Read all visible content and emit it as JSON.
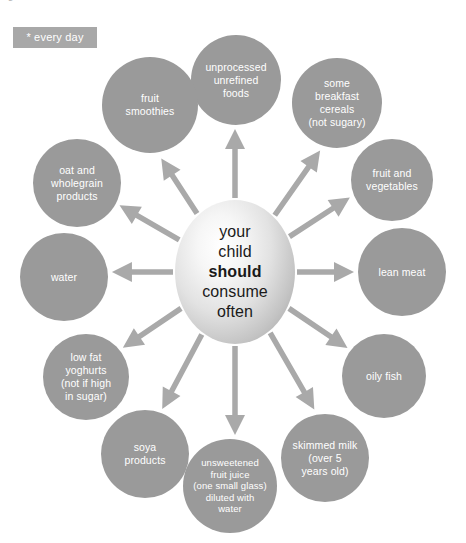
{
  "page": {
    "title": "your child should",
    "background_color": "#ffffff"
  },
  "legend": {
    "badge_label": "* every day",
    "badge_color": "#a8a8a8",
    "badge_text_color": "#ffffff"
  },
  "diagram": {
    "type": "radial hub and spoke",
    "arrow_color": "#a9a9a9",
    "node_color": "#9a9a9a",
    "node_text_color": "#ffffff",
    "hub": {
      "lines": [
        {
          "text": "your",
          "bold": false
        },
        {
          "text": "child",
          "bold": false
        },
        {
          "text": "should",
          "bold": true
        },
        {
          "text": "consume",
          "bold": false
        },
        {
          "text": "often",
          "bold": false
        }
      ],
      "text_color": "#1a1a1a",
      "cx": 235,
      "cy": 272,
      "rx": 60,
      "ry": 72
    },
    "nodes": [
      {
        "id": "unprocessed-unrefined-foods",
        "label": "unprocessed\nunrefined\nfoods",
        "cx": 236,
        "cy": 80,
        "r": 45,
        "small": false
      },
      {
        "id": "some-breakfast-cereals",
        "label": "some\nbreakfast\ncereals\n(not sugary)",
        "cx": 337,
        "cy": 103,
        "r": 45,
        "small": false
      },
      {
        "id": "fruit-and-vegetables",
        "label": "fruit and\nvegetables",
        "cx": 392,
        "cy": 180,
        "r": 41,
        "small": false
      },
      {
        "id": "lean-meat",
        "label": "lean meat",
        "cx": 402,
        "cy": 272,
        "r": 44,
        "small": false
      },
      {
        "id": "oily-fish",
        "label": "oily fish",
        "cx": 384,
        "cy": 376,
        "r": 42,
        "small": false
      },
      {
        "id": "skimmed-milk",
        "label": "skimmed milk\n(over 5\nyears old)",
        "cx": 325,
        "cy": 458,
        "r": 44,
        "small": false
      },
      {
        "id": "unsweetened-fruit-juice",
        "label": "unsweetened\nfruit juice\n(one small glass)\ndiluted with\nwater",
        "cx": 230,
        "cy": 486,
        "r": 47,
        "small": true
      },
      {
        "id": "soya-products",
        "label": "soya\nproducts",
        "cx": 145,
        "cy": 454,
        "r": 44,
        "small": false
      },
      {
        "id": "low-fat-yoghurts",
        "label": "low fat\nyoghurts\n(not if high\nin sugar)",
        "cx": 86,
        "cy": 377,
        "r": 43,
        "small": false
      },
      {
        "id": "water",
        "label": "water",
        "cx": 64,
        "cy": 277,
        "r": 44,
        "small": false
      },
      {
        "id": "oat-and-wholegrain-products",
        "label": "oat and\nwholegrain\nproducts",
        "cx": 77,
        "cy": 183,
        "r": 44,
        "small": false
      },
      {
        "id": "fruit-smoothies",
        "label": "fruit\nsmoothies",
        "cx": 150,
        "cy": 105,
        "r": 48,
        "small": false
      }
    ],
    "arrows": [
      {
        "id": "arrow-to-unprocessed-unrefined-foods",
        "angle_deg": 270
      },
      {
        "id": "arrow-to-some-breakfast-cereals",
        "angle_deg": 305
      },
      {
        "id": "arrow-to-fruit-and-vegetables",
        "angle_deg": 327
      },
      {
        "id": "arrow-to-lean-meat",
        "angle_deg": 0
      },
      {
        "id": "arrow-to-oily-fish",
        "angle_deg": 34
      },
      {
        "id": "arrow-to-skimmed-milk",
        "angle_deg": 60
      },
      {
        "id": "arrow-to-unsweetened-fruit-juice",
        "angle_deg": 90
      },
      {
        "id": "arrow-to-soya-products",
        "angle_deg": 118
      },
      {
        "id": "arrow-to-low-fat-yoghurts",
        "angle_deg": 146
      },
      {
        "id": "arrow-to-water",
        "angle_deg": 180
      },
      {
        "id": "arrow-to-oat-and-wholegrain-products",
        "angle_deg": 210
      },
      {
        "id": "arrow-to-fruit-smoothies",
        "angle_deg": 237
      }
    ]
  }
}
